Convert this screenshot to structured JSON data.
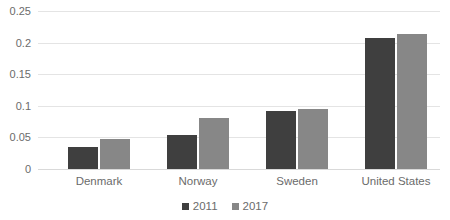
{
  "chart_data": {
    "type": "bar",
    "title": "",
    "xlabel": "",
    "ylabel": "",
    "categories": [
      "Denmark",
      "Norway",
      "Sweden",
      "United States"
    ],
    "series": [
      {
        "name": "2011",
        "color": "#3f3f3f",
        "values": [
          0.035,
          0.054,
          0.092,
          0.207
        ]
      },
      {
        "name": "2017",
        "color": "#878787",
        "values": [
          0.047,
          0.081,
          0.095,
          0.214
        ]
      }
    ],
    "ylim": [
      0,
      0.25
    ],
    "yticks": [
      "0",
      "0.05",
      "0.1",
      "0.15",
      "0.2",
      "0.25"
    ],
    "ytick_values": [
      0,
      0.05,
      0.1,
      0.15,
      0.2,
      0.25
    ],
    "grid": true,
    "legend_position": "bottom"
  },
  "legend": {
    "items": [
      {
        "label": "2011",
        "color": "#3f3f3f"
      },
      {
        "label": "2017",
        "color": "#878787"
      }
    ]
  },
  "axis": {
    "ticks": [
      "0.25",
      "0.2",
      "0.15",
      "0.1",
      "0.05",
      "0"
    ]
  },
  "categories": [
    "Denmark",
    "Norway",
    "Sweden",
    "United States"
  ],
  "title_sliver": ""
}
